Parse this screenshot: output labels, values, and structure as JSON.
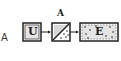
{
  "figure": {
    "panel_label": "A",
    "top_label": "A",
    "boxes": [
      {
        "id": "U",
        "label": "U",
        "style": "plain"
      },
      {
        "id": "middle",
        "label": "",
        "style": "diagonal-split-dotted"
      },
      {
        "id": "E",
        "label": "E",
        "style": "dotted"
      }
    ],
    "colors": {
      "stroke": "#222222",
      "fill": "#ffffff",
      "shade": "#d8d8d8"
    }
  }
}
